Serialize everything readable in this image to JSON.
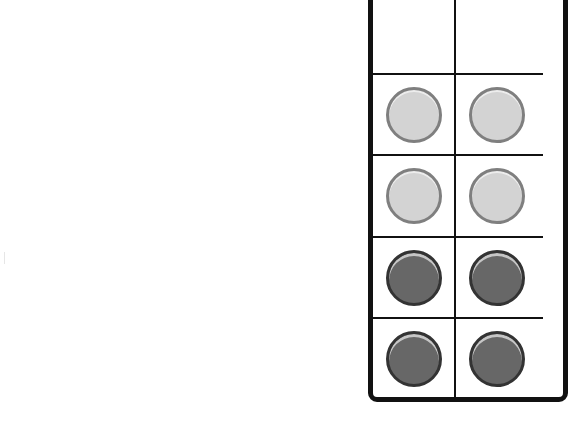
{
  "diagram": {
    "type": "ten-frame-counters",
    "visible_columns": 2,
    "visible_rows": 5,
    "colors": {
      "light_counter": "#d3d3d3",
      "light_counter_border": "#7f7f7f",
      "dark_counter": "#676767",
      "dark_counter_border": "#333333",
      "frame_line": "#111111"
    },
    "rows": [
      {
        "cells": [
          "empty",
          "empty"
        ]
      },
      {
        "cells": [
          "light",
          "light"
        ]
      },
      {
        "cells": [
          "light",
          "light"
        ]
      },
      {
        "cells": [
          "dark",
          "dark"
        ]
      },
      {
        "cells": [
          "dark",
          "dark"
        ]
      }
    ],
    "counts": {
      "light": 4,
      "dark": 4,
      "empty": 2
    }
  }
}
